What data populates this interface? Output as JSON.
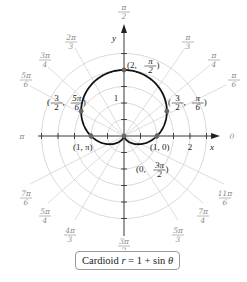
{
  "chart_data": {
    "type": "polar-line",
    "title": "Cardioid r = 1 + sin θ",
    "equation": "r = 1 + sin θ",
    "curve_name": "Cardioid",
    "radial_grid": [
      0.5,
      1,
      1.5,
      2,
      2.5
    ],
    "radial_tick_labels": [
      {
        "value": 1,
        "axis": "y",
        "label": "1"
      },
      {
        "value": 2,
        "axis": "x",
        "label": "2"
      }
    ],
    "angle_labels": [
      {
        "deg": 0,
        "label": "0"
      },
      {
        "deg": 30,
        "label": "π/6"
      },
      {
        "deg": 45,
        "label": "π/4"
      },
      {
        "deg": 60,
        "label": "π/3"
      },
      {
        "deg": 90,
        "label": "π/2"
      },
      {
        "deg": 120,
        "label": "2π/3"
      },
      {
        "deg": 135,
        "label": "3π/4"
      },
      {
        "deg": 150,
        "label": "5π/6"
      },
      {
        "deg": 180,
        "label": "π"
      },
      {
        "deg": 210,
        "label": "7π/6"
      },
      {
        "deg": 225,
        "label": "5π/4"
      },
      {
        "deg": 240,
        "label": "4π/3"
      },
      {
        "deg": 270,
        "label": "3π/2"
      },
      {
        "deg": 300,
        "label": "5π/3"
      },
      {
        "deg": 315,
        "label": "7π/4"
      },
      {
        "deg": 330,
        "label": "11π/6"
      }
    ],
    "axis_labels": {
      "x": "x",
      "y": "y"
    },
    "points": [
      {
        "r": 2,
        "theta": "π/2",
        "label": "(2, π/2)"
      },
      {
        "r": 1.5,
        "theta": "π/6",
        "label": "(3/2, π/6)"
      },
      {
        "r": 1.5,
        "theta": "5π/6",
        "label": "(3/2, 5π/6)"
      },
      {
        "r": 1,
        "theta": "0",
        "label": "(1, 0)"
      },
      {
        "r": 1,
        "theta": "π",
        "label": "(1, π)"
      },
      {
        "r": 0,
        "theta": "3π/2",
        "label": "(0, 3π/2)"
      }
    ],
    "colors": {
      "curve": "#111111",
      "grid": "#cfcfcf",
      "points": "#666666"
    }
  },
  "caption": {
    "name": "Cardioid",
    "r": "r",
    "eq": " = 1 + sin ",
    "theta": "θ"
  }
}
